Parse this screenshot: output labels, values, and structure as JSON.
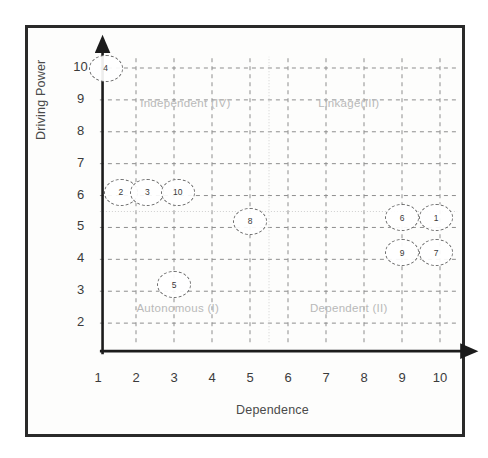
{
  "figure": {
    "caption": ""
  },
  "chart_data": {
    "type": "scatter",
    "title": "",
    "xlabel": "Dependence",
    "ylabel": "Driving Power",
    "xlim": [
      1,
      10
    ],
    "ylim": [
      1,
      10
    ],
    "xticks": [
      "1",
      "2",
      "3",
      "4",
      "5",
      "6",
      "7",
      "8",
      "9",
      "10"
    ],
    "yticks": [
      "2",
      "3",
      "4",
      "5",
      "6",
      "7",
      "8",
      "9",
      "10"
    ],
    "grid": true,
    "grid_style": "dashed",
    "legend": "none",
    "divider_x": 5.5,
    "divider_y": 5.5,
    "quadrants": [
      {
        "key": "autonomous",
        "label": "Autonomous (I)",
        "x": 3.1,
        "y": 2.4
      },
      {
        "key": "dependent",
        "label": "Dependent (II)",
        "x": 7.6,
        "y": 2.4
      },
      {
        "key": "linkage",
        "label": "Linkage(III)",
        "x": 7.6,
        "y": 8.85
      },
      {
        "key": "independent",
        "label": "Independent (IV)",
        "x": 3.3,
        "y": 8.85
      }
    ],
    "points": [
      {
        "label": "4",
        "x": 1.2,
        "y": 10.0
      },
      {
        "label": "2",
        "x": 1.6,
        "y": 6.1
      },
      {
        "label": "3",
        "x": 2.3,
        "y": 6.1
      },
      {
        "label": "10",
        "x": 3.1,
        "y": 6.1
      },
      {
        "label": "8",
        "x": 5.0,
        "y": 5.2
      },
      {
        "label": "6",
        "x": 9.0,
        "y": 5.3
      },
      {
        "label": "1",
        "x": 9.9,
        "y": 5.3
      },
      {
        "label": "9",
        "x": 9.0,
        "y": 4.2
      },
      {
        "label": "7",
        "x": 9.9,
        "y": 4.2
      },
      {
        "label": "5",
        "x": 3.0,
        "y": 3.2
      }
    ],
    "colors": {
      "axis": "#1c1c1c",
      "grid": "#8d8d8d",
      "divider": "#cfcfcf",
      "bubble_stroke": "#6d6d6d",
      "quadrant_text": "#b9b9b9",
      "frame": "#2a2a2a"
    }
  }
}
